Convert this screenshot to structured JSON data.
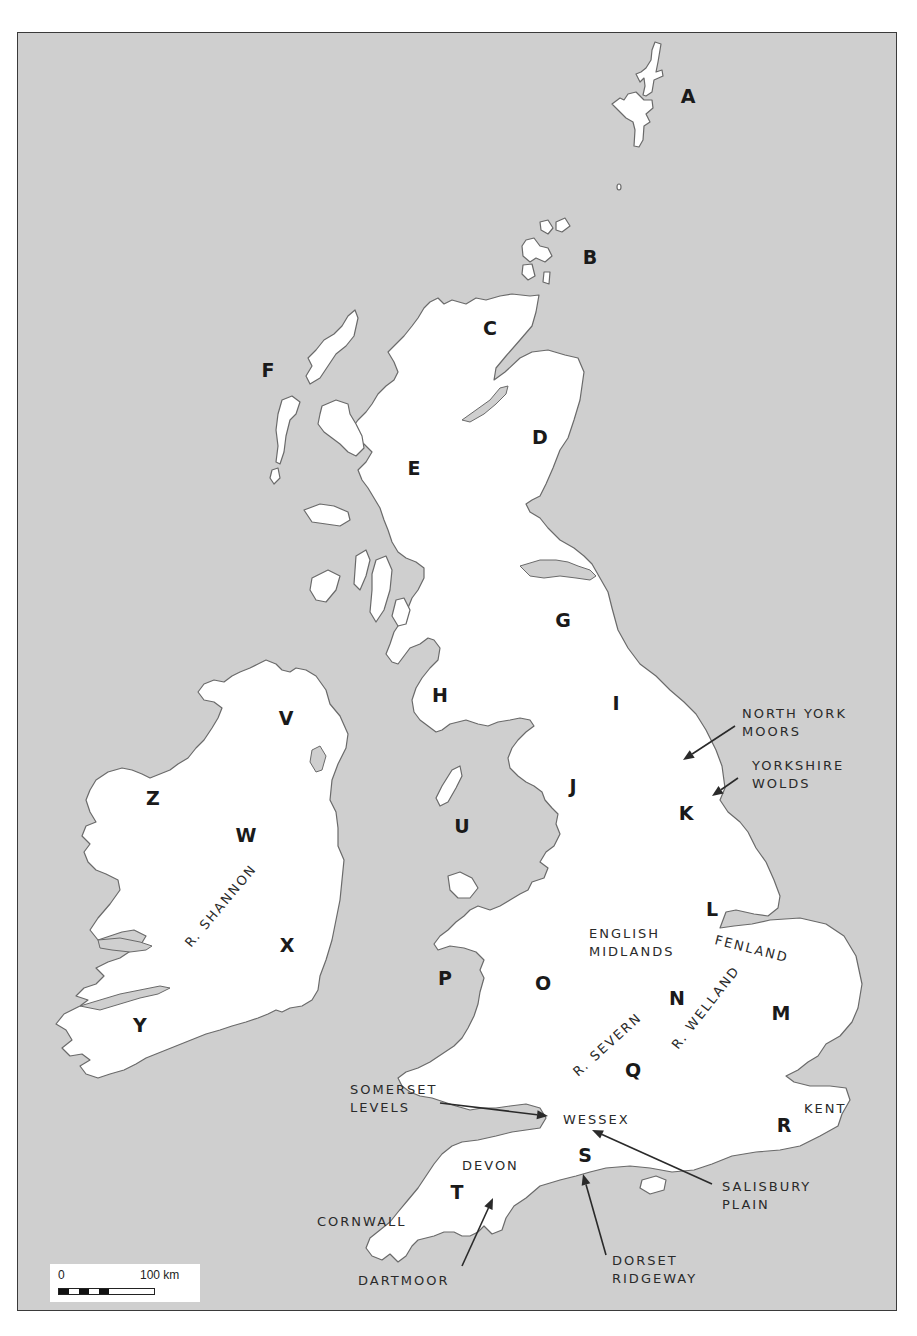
{
  "map": {
    "title": "Britain and Ireland — regions and landscape features",
    "colors": {
      "sea": "#cfcfcf",
      "land": "#ffffff",
      "coast": "#6a6a6a",
      "frame": "#3a3a3a",
      "text": "#1a1a1a"
    },
    "letter_labels": [
      {
        "id": "A",
        "text": "A",
        "x": 688,
        "y": 103,
        "area": "Shetland"
      },
      {
        "id": "B",
        "text": "B",
        "x": 590,
        "y": 264,
        "area": "Orkney"
      },
      {
        "id": "C",
        "text": "C",
        "x": 490,
        "y": 335,
        "area": "Northern Highlands"
      },
      {
        "id": "D",
        "text": "D",
        "x": 540,
        "y": 444,
        "area": "North-east Scotland"
      },
      {
        "id": "E",
        "text": "E",
        "x": 414,
        "y": 475,
        "area": "Western Highlands"
      },
      {
        "id": "F",
        "text": "F",
        "x": 268,
        "y": 377,
        "area": "Outer Hebrides"
      },
      {
        "id": "G",
        "text": "G",
        "x": 563,
        "y": 627,
        "area": "Southern Uplands / Borders"
      },
      {
        "id": "H",
        "text": "H",
        "x": 440,
        "y": 702,
        "area": "Galloway / Solway"
      },
      {
        "id": "I",
        "text": "I",
        "x": 616,
        "y": 710,
        "area": "Northern Pennines"
      },
      {
        "id": "J",
        "text": "J",
        "x": 573,
        "y": 793,
        "area": "Lancashire / Pennines"
      },
      {
        "id": "K",
        "text": "K",
        "x": 686,
        "y": 820,
        "area": "East Yorkshire"
      },
      {
        "id": "L",
        "text": "L",
        "x": 712,
        "y": 916,
        "area": "Lincolnshire"
      },
      {
        "id": "M",
        "text": "M",
        "x": 781,
        "y": 1020,
        "area": "East Anglia"
      },
      {
        "id": "N",
        "text": "N",
        "x": 677,
        "y": 1005,
        "area": "East Midlands"
      },
      {
        "id": "O",
        "text": "O",
        "x": 543,
        "y": 990,
        "area": "Wales / Marches"
      },
      {
        "id": "P",
        "text": "P",
        "x": 445,
        "y": 985,
        "area": "Cardigan Bay"
      },
      {
        "id": "Q",
        "text": "Q",
        "x": 633,
        "y": 1077,
        "area": "Thames Valley"
      },
      {
        "id": "R",
        "text": "R",
        "x": 784,
        "y": 1132,
        "area": "Kent"
      },
      {
        "id": "S",
        "text": "S",
        "x": 585,
        "y": 1162,
        "area": "Wessex south coast"
      },
      {
        "id": "T",
        "text": "T",
        "x": 457,
        "y": 1199,
        "area": "Devon"
      },
      {
        "id": "U",
        "text": "U",
        "x": 462,
        "y": 833,
        "area": "Irish Sea"
      },
      {
        "id": "V",
        "text": "V",
        "x": 286,
        "y": 725,
        "area": "Ulster"
      },
      {
        "id": "W",
        "text": "W",
        "x": 246,
        "y": 842,
        "area": "Central Ireland"
      },
      {
        "id": "X",
        "text": "X",
        "x": 287,
        "y": 952,
        "area": "Leinster"
      },
      {
        "id": "Y",
        "text": "Y",
        "x": 140,
        "y": 1032,
        "area": "Munster"
      },
      {
        "id": "Z",
        "text": "Z",
        "x": 153,
        "y": 805,
        "area": "Connacht"
      }
    ],
    "region_labels": [
      {
        "id": "north-york-moors",
        "lines": [
          "NORTH YORK",
          "MOORS"
        ],
        "x": 742,
        "y": 718
      },
      {
        "id": "yorkshire-wolds",
        "lines": [
          "YORKSHIRE",
          "WOLDS"
        ],
        "x": 752,
        "y": 770
      },
      {
        "id": "english-midlands",
        "lines": [
          "ENGLISH",
          "MIDLANDS"
        ],
        "x": 589,
        "y": 938
      },
      {
        "id": "fenland",
        "lines": [
          "FENLAND"
        ],
        "x": 714,
        "y": 944,
        "rotate": 14
      },
      {
        "id": "r-welland",
        "lines": [
          "R. WELLAND"
        ],
        "x": 678,
        "y": 1050,
        "rotate": -52
      },
      {
        "id": "r-severn",
        "lines": [
          "R. SEVERN"
        ],
        "x": 578,
        "y": 1077,
        "rotate": -42
      },
      {
        "id": "r-shannon",
        "lines": [
          "R. SHANNON"
        ],
        "x": 191,
        "y": 948,
        "rotate": -50
      },
      {
        "id": "somerset-levels",
        "lines": [
          "SOMERSET",
          "LEVELS"
        ],
        "x": 350,
        "y": 1094
      },
      {
        "id": "wessex",
        "lines": [
          "WESSEX"
        ],
        "x": 563,
        "y": 1124
      },
      {
        "id": "kent",
        "lines": [
          "KENT"
        ],
        "x": 804,
        "y": 1113
      },
      {
        "id": "devon",
        "lines": [
          "DEVON"
        ],
        "x": 462,
        "y": 1170
      },
      {
        "id": "cornwall",
        "lines": [
          "CORNWALL"
        ],
        "x": 317,
        "y": 1226
      },
      {
        "id": "salisbury-plain",
        "lines": [
          "SALISBURY",
          "PLAIN"
        ],
        "x": 722,
        "y": 1191
      },
      {
        "id": "dartmoor",
        "lines": [
          "DARTMOOR"
        ],
        "x": 358,
        "y": 1285
      },
      {
        "id": "dorset-ridgeway",
        "lines": [
          "DORSET",
          "RIDGEWAY"
        ],
        "x": 612,
        "y": 1265
      }
    ],
    "arrows": [
      {
        "id": "north-york-moors-arrow",
        "from": [
          735,
          726
        ],
        "to": [
          683,
          760
        ]
      },
      {
        "id": "yorkshire-wolds-arrow",
        "from": [
          738,
          778
        ],
        "to": [
          712,
          796
        ]
      },
      {
        "id": "somerset-levels-arrow",
        "from": [
          440,
          1103
        ],
        "to": [
          548,
          1116
        ]
      },
      {
        "id": "salisbury-plain-arrow",
        "from": [
          712,
          1184
        ],
        "to": [
          592,
          1130
        ]
      },
      {
        "id": "dartmoor-arrow",
        "from": [
          462,
          1266
        ],
        "to": [
          493,
          1198
        ]
      },
      {
        "id": "dorset-ridgeway-arrow",
        "from": [
          606,
          1255
        ],
        "to": [
          583,
          1174
        ]
      }
    ],
    "scale_bar": {
      "start_label": "0",
      "end_label": "100 km"
    }
  }
}
